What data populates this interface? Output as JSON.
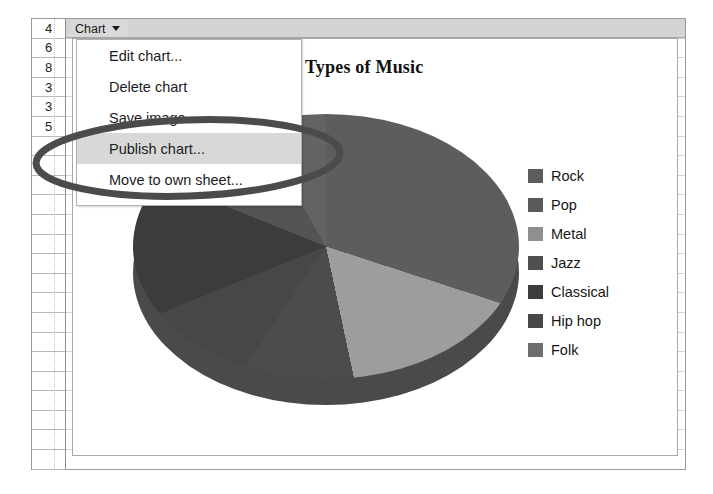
{
  "window": {
    "type": "spreadsheet-chart-editor"
  },
  "row_headers": [
    "4",
    "6",
    "8",
    "3",
    "3",
    "5"
  ],
  "toolbar": {
    "chart_button_label": "Chart",
    "caret_icon": "chevron-down-icon"
  },
  "menu": {
    "items": [
      {
        "label": "Edit chart...",
        "highlighted": false
      },
      {
        "label": "Delete chart",
        "highlighted": false
      },
      {
        "label": "Save image",
        "highlighted": false
      },
      {
        "label": "Publish chart...",
        "highlighted": true
      },
      {
        "label": "Move to own sheet...",
        "highlighted": false
      }
    ]
  },
  "annotation": {
    "shape": "ellipse",
    "color": "#4b4b4b",
    "targets": "Publish chart..."
  },
  "chart_data": {
    "type": "pie",
    "title": "Types of Music",
    "xlabel": "",
    "ylabel": "",
    "legend_position": "right",
    "three_d": true,
    "categories": [
      "Rock",
      "Pop",
      "Metal",
      "Jazz",
      "Classical",
      "Hip hop",
      "Folk"
    ],
    "values": [
      30,
      17,
      13,
      9,
      12,
      11,
      8
    ],
    "colors": [
      "#5d5d5d",
      "#9d9d9d",
      "#4c4c4c",
      "#474747",
      "#3c3c3c",
      "#545454",
      "#636363"
    ],
    "legend": [
      {
        "label": "Rock",
        "color": "#5d5d5d"
      },
      {
        "label": "Pop",
        "color": "#5a5a5a"
      },
      {
        "label": "Metal",
        "color": "#8f8f8f"
      },
      {
        "label": "Jazz",
        "color": "#4f4f4f"
      },
      {
        "label": "Classical",
        "color": "#3c3c3c"
      },
      {
        "label": "Hip hop",
        "color": "#484848"
      },
      {
        "label": "Folk",
        "color": "#6d6d6d"
      }
    ]
  }
}
